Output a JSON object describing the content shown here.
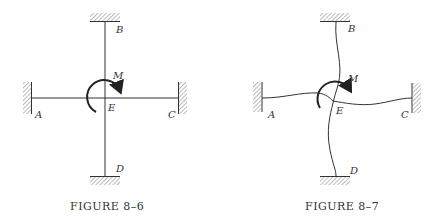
{
  "figures": [
    {
      "caption": "Figure 8–6",
      "caption_display": "FIGURE 8–6",
      "description": "Undeformed frame: four members meeting at rigid joint E, fixed supports at A, B, C, D, applied moment M at E",
      "labels": {
        "A": "A",
        "B": "B",
        "C": "C",
        "D": "D",
        "E": "E",
        "M": "M"
      }
    },
    {
      "caption": "Figure 8–7",
      "caption_display": "FIGURE 8–7",
      "description": "Deformed shape of the frame under moment M at joint E",
      "labels": {
        "A": "A",
        "B": "B",
        "C": "C",
        "D": "D",
        "E": "E",
        "M": "M"
      }
    }
  ],
  "colors": {
    "line": "#333333",
    "hatch": "#777777",
    "background": "#ffffff"
  }
}
